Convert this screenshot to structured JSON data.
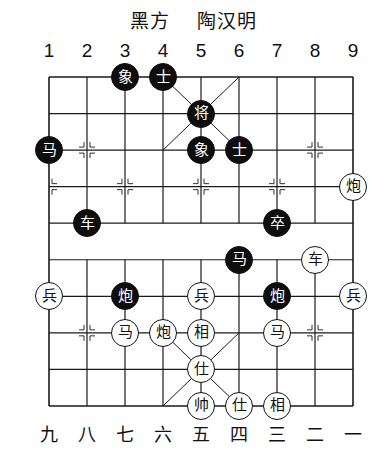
{
  "title": {
    "side": "黑方",
    "player": "陶汉明"
  },
  "column_labels_top": [
    "1",
    "2",
    "3",
    "4",
    "5",
    "6",
    "7",
    "8",
    "9"
  ],
  "column_labels_bottom": [
    "九",
    "八",
    "七",
    "六",
    "五",
    "四",
    "三",
    "二",
    "一"
  ],
  "board": {
    "columns": 9,
    "rows": 10,
    "line_color": "#1a1a1a"
  },
  "pieces": [
    {
      "side": "black",
      "char": "象",
      "col": 3,
      "row": 0,
      "name": "black-elephant"
    },
    {
      "side": "black",
      "char": "士",
      "col": 4,
      "row": 0,
      "name": "black-advisor"
    },
    {
      "side": "black",
      "char": "将",
      "col": 5,
      "row": 1,
      "name": "black-general"
    },
    {
      "side": "black",
      "char": "马",
      "col": 1,
      "row": 2,
      "name": "black-horse"
    },
    {
      "side": "black",
      "char": "象",
      "col": 5,
      "row": 2,
      "name": "black-elephant"
    },
    {
      "side": "black",
      "char": "士",
      "col": 6,
      "row": 2,
      "name": "black-advisor"
    },
    {
      "side": "black",
      "char": "车",
      "col": 2,
      "row": 4,
      "name": "black-chariot"
    },
    {
      "side": "black",
      "char": "卒",
      "col": 7,
      "row": 4,
      "name": "black-soldier"
    },
    {
      "side": "black",
      "char": "马",
      "col": 6,
      "row": 5,
      "name": "black-horse"
    },
    {
      "side": "black",
      "char": "炮",
      "col": 3,
      "row": 6,
      "name": "black-cannon"
    },
    {
      "side": "black",
      "char": "炮",
      "col": 7,
      "row": 6,
      "name": "black-cannon"
    },
    {
      "side": "red",
      "char": "炮",
      "col": 9,
      "row": 3,
      "name": "red-cannon"
    },
    {
      "side": "red",
      "char": "车",
      "col": 8,
      "row": 5,
      "name": "red-chariot"
    },
    {
      "side": "red",
      "char": "兵",
      "col": 1,
      "row": 6,
      "name": "red-soldier"
    },
    {
      "side": "red",
      "char": "兵",
      "col": 5,
      "row": 6,
      "name": "red-soldier"
    },
    {
      "side": "red",
      "char": "兵",
      "col": 9,
      "row": 6,
      "name": "red-soldier"
    },
    {
      "side": "red",
      "char": "马",
      "col": 3,
      "row": 7,
      "name": "red-horse"
    },
    {
      "side": "red",
      "char": "炮",
      "col": 4,
      "row": 7,
      "name": "red-cannon"
    },
    {
      "side": "red",
      "char": "相",
      "col": 5,
      "row": 7,
      "name": "red-elephant"
    },
    {
      "side": "red",
      "char": "马",
      "col": 7,
      "row": 7,
      "name": "red-horse"
    },
    {
      "side": "red",
      "char": "仕",
      "col": 5,
      "row": 8,
      "name": "red-advisor"
    },
    {
      "side": "red",
      "char": "帅",
      "col": 5,
      "row": 9,
      "name": "red-general"
    },
    {
      "side": "red",
      "char": "仕",
      "col": 6,
      "row": 9,
      "name": "red-advisor"
    },
    {
      "side": "red",
      "char": "相",
      "col": 7,
      "row": 9,
      "name": "red-elephant"
    }
  ]
}
